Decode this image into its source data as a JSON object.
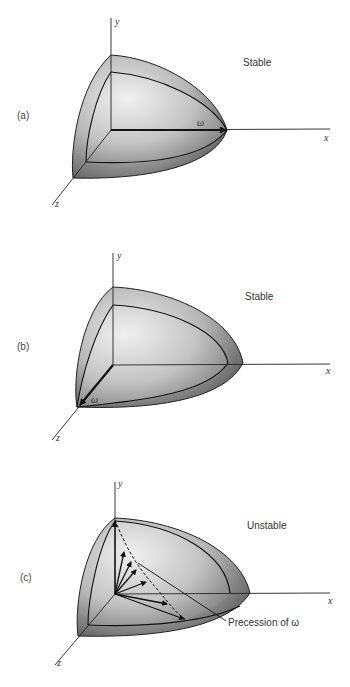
{
  "figure": {
    "panels": [
      {
        "id": "a",
        "label": "(a)",
        "state": "Stable",
        "omega_label": "ω",
        "axes": {
          "x": "x",
          "y": "y",
          "z": "z"
        },
        "omega_direction": "along x-axis"
      },
      {
        "id": "b",
        "label": "(b)",
        "state": "Stable",
        "omega_label": "ω",
        "axes": {
          "x": "x",
          "y": "y",
          "z": "z"
        },
        "omega_direction": "along z-axis"
      },
      {
        "id": "c",
        "label": "(c)",
        "state": "Unstable",
        "omega_label": "ω",
        "axes": {
          "x": "x",
          "y": "y",
          "z": "z"
        },
        "omega_direction": "precessing from y-axis toward x-axis",
        "annotation": "Precession of ω"
      }
    ],
    "colors": {
      "shell_dark": "#5a5a5a",
      "shell_light": "#e6e6e6",
      "line": "#1a1a1a",
      "text": "#333333"
    }
  }
}
